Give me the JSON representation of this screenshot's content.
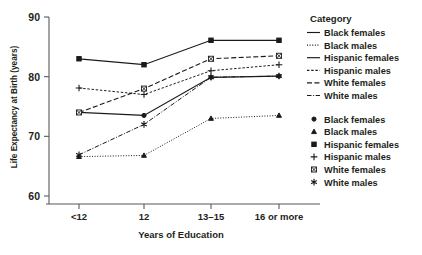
{
  "chart_data": {
    "type": "line",
    "title": "",
    "xlabel": "Years of Education",
    "ylabel": "Life Expectancy at Birth (years)",
    "categories": [
      "<12",
      "12",
      "13–15",
      "16 or more"
    ],
    "ylim": [
      60,
      90
    ],
    "yticks": [
      60,
      70,
      80,
      90
    ],
    "grid": false,
    "legend_position": "right",
    "legend_title": "Category",
    "series": [
      {
        "name": "Black females",
        "values": [
          74.0,
          73.5,
          79.9,
          80.1
        ],
        "marker": "circle",
        "linestyle": "solid"
      },
      {
        "name": "Black males",
        "values": [
          66.6,
          66.8,
          73.0,
          73.5
        ],
        "marker": "triangle",
        "linestyle": "dotted"
      },
      {
        "name": "Hispanic females",
        "values": [
          83.0,
          82.0,
          86.1,
          86.1
        ],
        "marker": "square",
        "linestyle": "solid"
      },
      {
        "name": "Hispanic males",
        "values": [
          78.1,
          77.0,
          81.0,
          82.0
        ],
        "marker": "plus",
        "linestyle": "dashed-short"
      },
      {
        "name": "White females",
        "values": [
          74.0,
          78.0,
          83.0,
          83.5
        ],
        "marker": "boxed-x",
        "linestyle": "dashed-long"
      },
      {
        "name": "White males",
        "values": [
          66.9,
          72.0,
          79.9,
          80.1
        ],
        "marker": "asterisk",
        "linestyle": "dash-dot"
      }
    ]
  },
  "axes": {
    "y_tick_labels": [
      "90",
      "80",
      "70",
      "60"
    ],
    "x_tick_labels": [
      "<12",
      "12",
      "13–15",
      "16 or more"
    ],
    "x_axis_title": "Years of Education",
    "y_axis_title": "Life Expectancy at Birth (years)"
  },
  "legend": {
    "title": "Category",
    "line_entries": [
      {
        "label": "Black females",
        "style": "solid"
      },
      {
        "label": "Black males",
        "style": "dotted"
      },
      {
        "label": "Hispanic females",
        "style": "solid"
      },
      {
        "label": "Hispanic males",
        "style": "dashed-short"
      },
      {
        "label": "White females",
        "style": "dashed-long"
      },
      {
        "label": "White males",
        "style": "dash-dot"
      }
    ],
    "marker_entries": [
      {
        "label": "Black females",
        "marker": "circle"
      },
      {
        "label": "Black males",
        "marker": "triangle"
      },
      {
        "label": "Hispanic females",
        "marker": "square"
      },
      {
        "label": "Hispanic males",
        "marker": "plus"
      },
      {
        "label": "White females",
        "marker": "boxed-x"
      },
      {
        "label": "White males",
        "marker": "asterisk"
      }
    ]
  },
  "colors": {
    "ink": "#231f20",
    "line": "#1a1a1a",
    "axis": "#58595b",
    "background": "#ffffff"
  }
}
